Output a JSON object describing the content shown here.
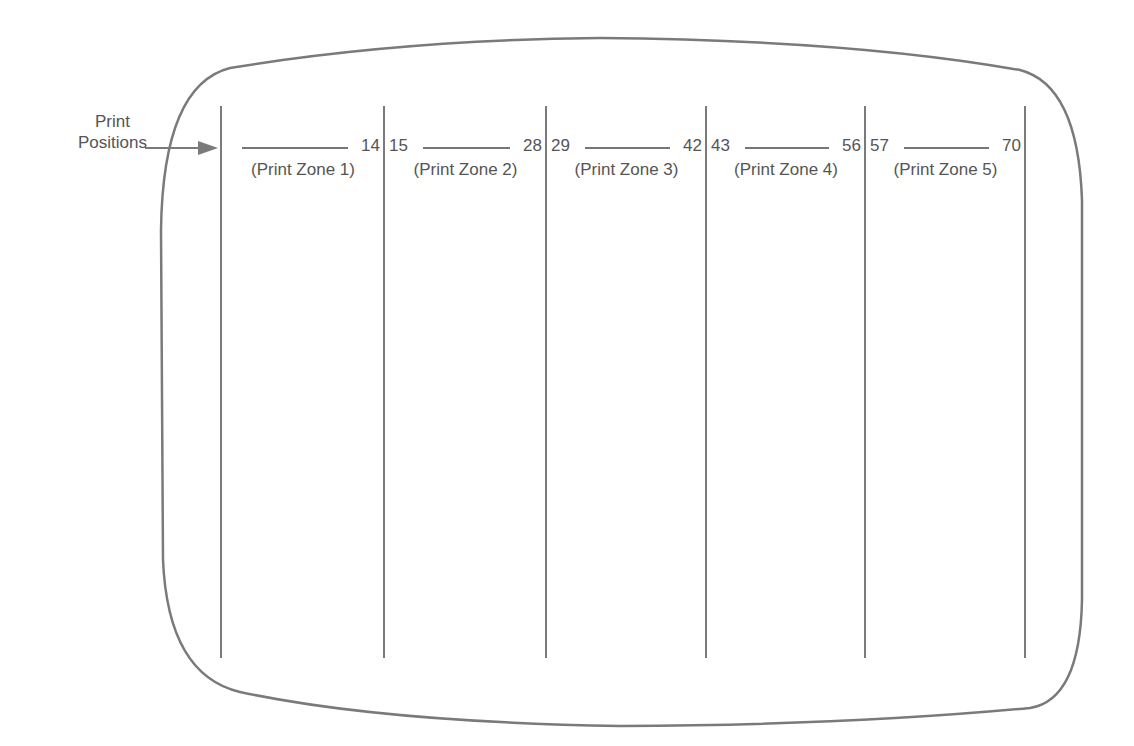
{
  "diagram": {
    "type": "screen-layout",
    "pointer_label": [
      "Print",
      "Positions"
    ],
    "line_color": "#7a7a7a",
    "text_color": "#555555",
    "zones": [
      {
        "start": "",
        "end": "14",
        "name": "(Print Zone 1)"
      },
      {
        "start": "15",
        "end": "28",
        "name": "(Print Zone 2)"
      },
      {
        "start": "29",
        "end": "42",
        "name": "(Print Zone 3)"
      },
      {
        "start": "43",
        "end": "56",
        "name": "(Print Zone 4)"
      },
      {
        "start": "57",
        "end": "70",
        "name": "(Print Zone 5)"
      }
    ]
  }
}
